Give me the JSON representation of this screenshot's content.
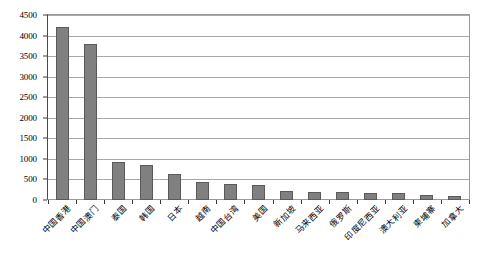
{
  "chart_data": {
    "type": "bar",
    "title": "",
    "subtitle": "",
    "xlabel": "",
    "ylabel": "",
    "ylim": [
      0,
      4500
    ],
    "ytick_step": 500,
    "grid": true,
    "legend": "none",
    "bar_color": "#808080",
    "bar_border_color": "#5a5a5a",
    "gridline_color": "#a8a8a8",
    "axis_color": "#3a3a3a",
    "ytick_labels": [
      "0",
      "500",
      "1000",
      "1500",
      "2000",
      "2500",
      "3000",
      "3500",
      "4000",
      "4500"
    ],
    "ytick_values": [
      0,
      500,
      1000,
      1500,
      2000,
      2500,
      3000,
      3500,
      4000,
      4500
    ],
    "categories": [
      "中国香港",
      "中国澳门",
      "泰国",
      "韩国",
      "日本",
      "越南",
      "中国台湾",
      "美国",
      "新加坡",
      "马来西亚",
      "俄罗斯",
      "印度尼西亚",
      "澳大利亚",
      "柬埔寨",
      "加拿大"
    ],
    "values": [
      4220,
      3790,
      930,
      840,
      630,
      440,
      400,
      370,
      230,
      200,
      190,
      180,
      170,
      120,
      90
    ],
    "series": [
      {
        "name": "",
        "values": [
          4220,
          3790,
          930,
          840,
          630,
          440,
          400,
          370,
          230,
          200,
          190,
          180,
          170,
          120,
          90
        ]
      }
    ]
  }
}
